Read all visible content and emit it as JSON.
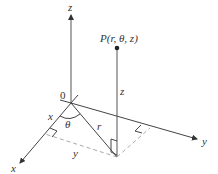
{
  "diagram": {
    "axes": {
      "x_label": "x",
      "y_label": "y",
      "z_label": "z"
    },
    "origin_label": "0",
    "point_label": "P(r, θ, z)",
    "segment_labels": {
      "x": "x",
      "y": "y",
      "r": "r",
      "z": "z",
      "theta": "θ"
    },
    "colors": {
      "line": "#444444",
      "dashed": "#aaaaaa",
      "text": "#333333",
      "background": "#ffffff"
    }
  }
}
